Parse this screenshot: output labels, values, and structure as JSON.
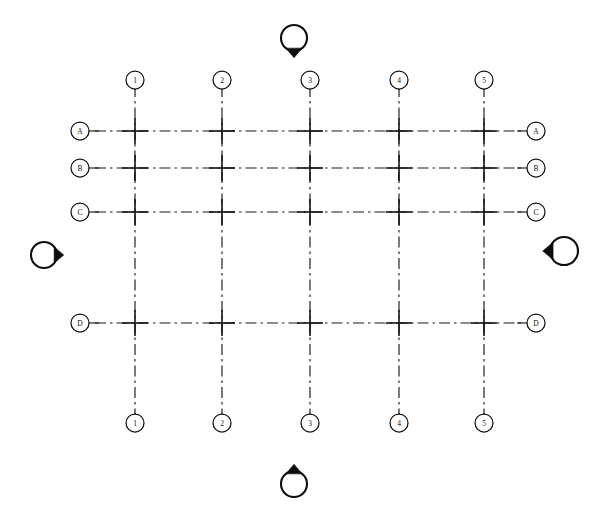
{
  "drawing": {
    "title": "Structural Grid Plan",
    "sheet_width": 595,
    "sheet_height": 517,
    "background_color": "#ffffff",
    "line_color": "#1a1a1a",
    "line_style": "dash-dot chain line",
    "bubble_fill": "#ffffff",
    "marker_fill": "#0d0d0d"
  },
  "chart_data": {
    "type": "diagram",
    "grid_extent": {
      "x_min": 95,
      "x_max": 521,
      "y_min": 86,
      "y_max": 417
    },
    "vertical_gridlines": [
      {
        "label": "1",
        "x": 135,
        "y_top": 86,
        "y_bottom": 417
      },
      {
        "label": "2",
        "x": 222,
        "y_top": 86,
        "y_bottom": 417
      },
      {
        "label": "3",
        "x": 310,
        "y_top": 86,
        "y_bottom": 417
      },
      {
        "label": "4",
        "x": 399,
        "y_top": 86,
        "y_bottom": 417
      },
      {
        "label": "5",
        "x": 484,
        "y_top": 86,
        "y_bottom": 417
      }
    ],
    "horizontal_gridlines": [
      {
        "label": "A",
        "y": 131,
        "x_left": 95,
        "x_right": 521
      },
      {
        "label": "B",
        "y": 168,
        "x_left": 95,
        "x_right": 521
      },
      {
        "label": "C",
        "y": 212,
        "x_left": 95,
        "x_right": 521
      },
      {
        "label": "D",
        "y": 323,
        "x_left": 95,
        "x_right": 521
      }
    ],
    "column_spacings": [
      87,
      88,
      89,
      85
    ],
    "row_spacings": [
      37,
      44,
      111
    ]
  },
  "top_bubbles": [
    {
      "label": "1",
      "cx": 135,
      "cy": 80,
      "r": 9
    },
    {
      "label": "2",
      "cx": 222,
      "cy": 80,
      "r": 9
    },
    {
      "label": "3",
      "cx": 310,
      "cy": 80,
      "r": 9
    },
    {
      "label": "4",
      "cx": 399,
      "cy": 80,
      "r": 9
    },
    {
      "label": "5",
      "cx": 484,
      "cy": 80,
      "r": 9
    }
  ],
  "bottom_bubbles": [
    {
      "label": "1",
      "cx": 135,
      "cy": 423,
      "r": 9
    },
    {
      "label": "2",
      "cx": 222,
      "cy": 423,
      "r": 9
    },
    {
      "label": "3",
      "cx": 310,
      "cy": 423,
      "r": 9
    },
    {
      "label": "4",
      "cx": 399,
      "cy": 423,
      "r": 9
    },
    {
      "label": "5",
      "cx": 484,
      "cy": 423,
      "r": 9
    }
  ],
  "left_bubbles": [
    {
      "label": "A",
      "cx": 80,
      "cy": 131,
      "r": 9
    },
    {
      "label": "B",
      "cx": 80,
      "cy": 168,
      "r": 9
    },
    {
      "label": "C",
      "cx": 80,
      "cy": 212,
      "r": 9
    },
    {
      "label": "D",
      "cx": 80,
      "cy": 323,
      "r": 9
    }
  ],
  "right_bubbles": [
    {
      "label": "A",
      "cx": 536,
      "cy": 131,
      "r": 9
    },
    {
      "label": "B",
      "cx": 536,
      "cy": 168,
      "r": 9
    },
    {
      "label": "C",
      "cx": 536,
      "cy": 212,
      "r": 9
    },
    {
      "label": "D",
      "cx": 536,
      "cy": 323,
      "r": 9
    }
  ],
  "section_markers": [
    {
      "name": "top-section-marker",
      "label": "",
      "cx": 294,
      "cy": 38,
      "r": 13,
      "direction": "down"
    },
    {
      "name": "bottom-section-marker",
      "label": "",
      "cx": 294,
      "cy": 484,
      "r": 13,
      "direction": "up"
    },
    {
      "name": "left-section-marker",
      "label": "",
      "cx": 44,
      "cy": 255,
      "r": 13,
      "direction": "right"
    },
    {
      "name": "right-section-marker",
      "label": "",
      "cx": 564,
      "cy": 251,
      "r": 14,
      "direction": "left"
    }
  ]
}
